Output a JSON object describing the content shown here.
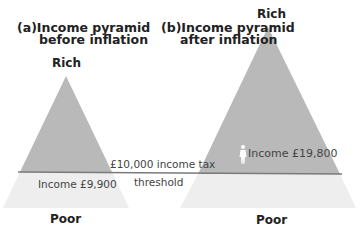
{
  "panels": [
    {
      "id": "a",
      "title_line1": "(a)Income pyramid",
      "title_line2": "before inflation",
      "top_label": "Rich",
      "bottom_label": "Poor",
      "income_label": "Income £9,900"
    },
    {
      "id": "b",
      "title_line1": "(b)Income pyramid",
      "title_line2": "after inflation",
      "top_label": "Rich",
      "bottom_label": "Poor",
      "income_label": "Income £19,800"
    }
  ],
  "threshold": {
    "line1": "£10,000 income tax",
    "line2": "threshold"
  },
  "colors": {
    "pyramid_above": "#b8b8b8",
    "pyramid_below": "#efefef",
    "threshold_line": "#7a7a7a",
    "person_icon": "#ffffff"
  },
  "icons": {
    "person": "person-figure-icon"
  }
}
